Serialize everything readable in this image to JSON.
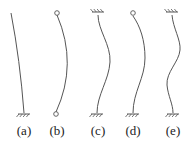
{
  "diagram": {
    "title": "",
    "stroke_color": "#555555",
    "columns": [
      {
        "label": "(a)",
        "top_support": "free",
        "bottom_support": "fixed",
        "label_x": 24,
        "path": "M 11 13 Q 20 60 24 113",
        "top": {
          "x": 11,
          "y": 13
        },
        "bottom": {
          "x": 24,
          "y": 113
        }
      },
      {
        "label": "(b)",
        "top_support": "pinned",
        "bottom_support": "pinned",
        "label_x": 57,
        "path": "M 57 15 Q 78 64 56 112",
        "top": {
          "x": 57,
          "y": 13
        },
        "bottom": {
          "x": 56,
          "y": 114
        }
      },
      {
        "label": "(c)",
        "top_support": "fixed",
        "bottom_support": "fixed",
        "label_x": 98,
        "path": "M 98 15 C 98 30 111 45 110 62 C 109 80 97 95 97 113",
        "top": {
          "x": 98,
          "y": 13
        },
        "bottom": {
          "x": 97,
          "y": 113
        }
      },
      {
        "label": "(d)",
        "top_support": "pinned",
        "bottom_support": "fixed",
        "label_x": 133,
        "path": "M 133 16 C 140 26 145 40 145 58 C 145 78 133 92 133 113",
        "top": {
          "x": 133,
          "y": 13
        },
        "bottom": {
          "x": 133,
          "y": 113
        }
      },
      {
        "label": "(e)",
        "top_support": "fixed",
        "bottom_support": "fixed",
        "label_x": 173,
        "path": "M 172 15 C 173 28 181 40 180 50 C 179 62 166 72 167 85 C 168 96 173 104 173 113",
        "top": {
          "x": 172,
          "y": 13
        },
        "bottom": {
          "x": 173,
          "y": 113
        }
      }
    ]
  }
}
